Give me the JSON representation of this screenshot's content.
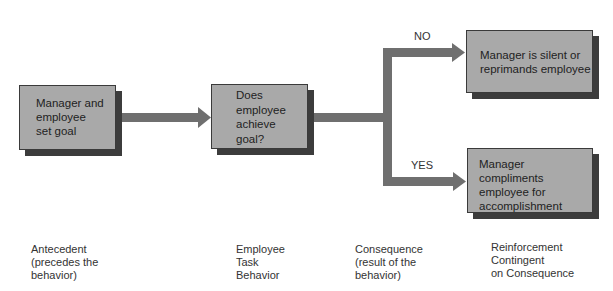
{
  "colors": {
    "box_fill": "#a9a9a9",
    "box_shadow": "#3c3c3c",
    "arrow": "#6f6f6f",
    "text": "#2a2a2a"
  },
  "boxes": {
    "antecedent": "Manager and\nemployee\nset goal",
    "behavior": "Does\nemployee\nachieve\ngoal?",
    "no_outcome": "Manager is silent or\nreprimands employee",
    "yes_outcome": "Manager compliments\nemployee for\naccomplishment"
  },
  "branches": {
    "no": "NO",
    "yes": "YES"
  },
  "captions": [
    "Antecedent\n(precedes the\nbehavior)",
    "Employee\nTask\nBehavior",
    "Consequence\n(result of the\nbehavior)",
    "Reinforcement\nContingent\non Consequence"
  ]
}
